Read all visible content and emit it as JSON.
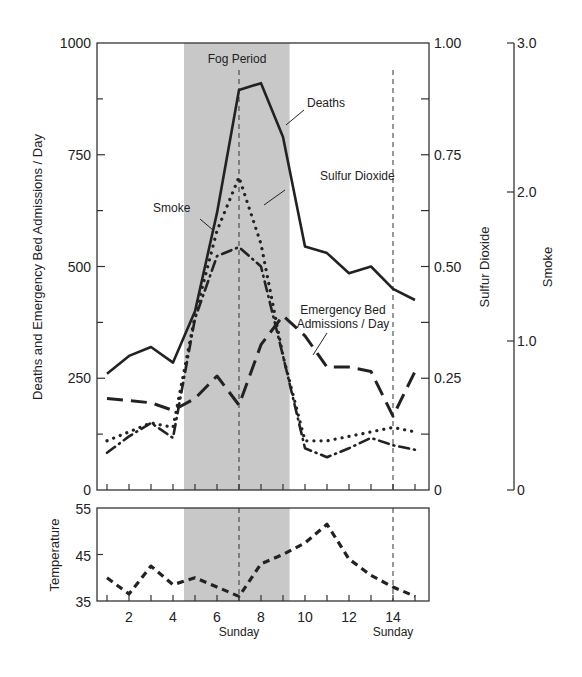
{
  "chart_data": [
    {
      "type": "line",
      "title": "",
      "shaded_region": {
        "label": "Fog Period",
        "x_start": 4.5,
        "x_end": 9.3
      },
      "reference_lines": [
        {
          "x": 7,
          "label": "Sunday"
        },
        {
          "x": 14,
          "label": "Sunday"
        }
      ],
      "x": [
        1,
        2,
        3,
        4,
        5,
        6,
        7,
        8,
        9,
        10,
        11,
        12,
        13,
        14,
        15
      ],
      "xticks": [
        2,
        4,
        6,
        8,
        10,
        12,
        14
      ],
      "xlabel": "",
      "axes": {
        "left": {
          "label": "Deaths and Emergency Bed Admissions / Day",
          "range": [
            0,
            1000
          ],
          "ticks": [
            "0",
            "250",
            "500",
            "750",
            "1000"
          ]
        },
        "right1": {
          "label": "Sulfur Dioxide",
          "range": [
            0,
            1.0
          ],
          "ticks": [
            "0",
            "0.25",
            "0.50",
            "0.75",
            "1.00"
          ]
        },
        "right2": {
          "label": "Smoke",
          "range": [
            0,
            3.0
          ],
          "ticks": [
            "0",
            "1.0",
            "2.0",
            "3.0"
          ]
        }
      },
      "series": [
        {
          "name": "Deaths",
          "axis": "left",
          "style": "solid",
          "values": [
            260,
            300,
            320,
            285,
            400,
            620,
            895,
            910,
            790,
            545,
            530,
            485,
            500,
            450,
            425
          ]
        },
        {
          "name": "Emergency Bed Admissions / Day",
          "axis": "left",
          "style": "long-dash",
          "values": [
            205,
            200,
            195,
            178,
            205,
            255,
            190,
            325,
            390,
            345,
            275,
            275,
            265,
            165,
            265
          ]
        },
        {
          "name": "Sulfur Dioxide",
          "axis": "right1",
          "style": "dotted",
          "values": [
            0.11,
            0.13,
            0.15,
            0.14,
            0.39,
            0.58,
            0.7,
            0.55,
            0.3,
            0.11,
            0.11,
            0.12,
            0.13,
            0.14,
            0.13
          ]
        },
        {
          "name": "Smoke",
          "axis": "right2",
          "style": "dash-dot",
          "values": [
            0.25,
            0.36,
            0.45,
            0.35,
            1.15,
            1.57,
            1.63,
            1.5,
            0.9,
            0.28,
            0.22,
            0.28,
            0.35,
            0.3,
            0.27
          ]
        }
      ],
      "annotations": [
        "Fog Period",
        "Deaths",
        "Sulfur Dioxide",
        "Smoke",
        "Emergency Bed Admissions / Day"
      ]
    },
    {
      "type": "line",
      "title": "",
      "ylabel": "Temperature",
      "ylim": [
        35,
        55
      ],
      "yticks": [
        "35",
        "45",
        "55"
      ],
      "x": [
        1,
        2,
        3,
        4,
        5,
        6,
        7,
        8,
        9,
        10,
        11,
        12,
        13,
        14,
        15
      ],
      "xticks": [
        2,
        4,
        6,
        8,
        10,
        12,
        14
      ],
      "xtick_sublabels": [
        {
          "x": 7,
          "label": "Sunday"
        },
        {
          "x": 14,
          "label": "Sunday"
        }
      ],
      "series": [
        {
          "name": "Temperature",
          "style": "short-dash",
          "values": [
            40,
            36.5,
            42.5,
            38.5,
            40,
            38,
            36,
            43,
            45,
            47.5,
            51.5,
            44,
            40.5,
            38,
            36
          ]
        }
      ]
    }
  ],
  "labels": {
    "fog": "Fog Period",
    "deaths": "Deaths",
    "so2": "Sulfur Dioxide",
    "smoke": "Smoke",
    "ebd1": "Emergency Bed",
    "ebd2": "Admissions / Day",
    "left_axis": "Deaths and Emergency Bed Admissions / Day",
    "so2_axis": "Sulfur Dioxide",
    "smoke_axis": "Smoke",
    "temp_axis": "Temperature",
    "sunday": "Sunday"
  },
  "colors": {
    "shade": "#c8c8c8",
    "line": "#222222",
    "frame": "#333333"
  }
}
